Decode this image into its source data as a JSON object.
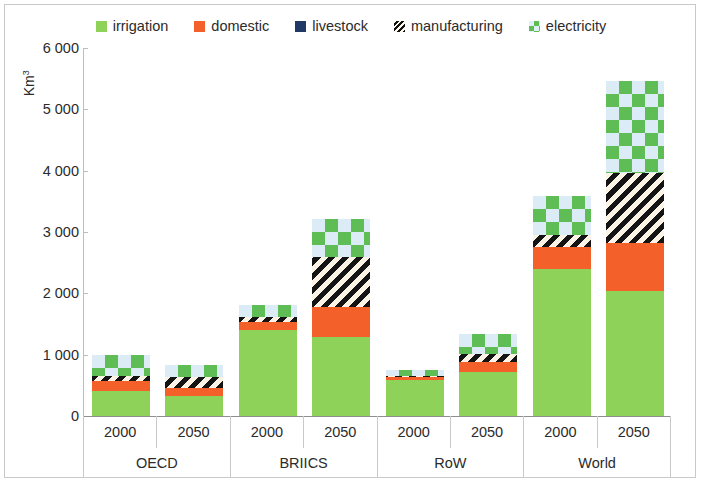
{
  "chart_data": {
    "type": "bar",
    "stacked": true,
    "title": "",
    "xlabel": "",
    "ylabel": "Km3",
    "ylabel_display": "Km",
    "ylabel_superscript": "3",
    "ylim": [
      0,
      6000
    ],
    "y_ticks": [
      "0",
      "1 000",
      "2 000",
      "3 000",
      "4 000",
      "5 000",
      "6 000"
    ],
    "y_tick_values": [
      0,
      1000,
      2000,
      3000,
      4000,
      5000,
      6000
    ],
    "grid": false,
    "legend_position": "top",
    "groups": [
      "OECD",
      "BRIICS",
      "RoW",
      "World"
    ],
    "years": [
      "2000",
      "2050"
    ],
    "categories": [
      "OECD 2000",
      "OECD 2050",
      "BRIICS 2000",
      "BRIICS 2050",
      "RoW 2000",
      "RoW 2050",
      "World 2000",
      "World 2050"
    ],
    "series": [
      {
        "name": "irrigation",
        "color": "#8ed25a",
        "pattern": "solid",
        "values": [
          400,
          330,
          1400,
          1290,
          590,
          720,
          2390,
          2040
        ]
      },
      {
        "name": "domestic",
        "color": "#f4602a",
        "pattern": "solid",
        "values": [
          170,
          120,
          140,
          480,
          40,
          160,
          360,
          780
        ]
      },
      {
        "name": "livestock",
        "color": "#1f3864",
        "pattern": "solid",
        "values": [
          0,
          0,
          0,
          0,
          0,
          0,
          0,
          0
        ]
      },
      {
        "name": "manufacturing",
        "color": "#141414",
        "pattern": "diagonal-hatch",
        "values": [
          90,
          185,
          75,
          830,
          30,
          135,
          200,
          1140
        ]
      },
      {
        "name": "electricity",
        "color": "#5fbd56",
        "pattern": "diamond-check",
        "values": [
          340,
          205,
          200,
          620,
          90,
          330,
          640,
          1510
        ]
      }
    ],
    "totals": [
      1000,
      840,
      1815,
      3220,
      750,
      1345,
      3590,
      5470
    ]
  },
  "legend": {
    "items": [
      {
        "label": "irrigation",
        "icon": "square-swatch-icon",
        "swatch_class": "sw-irrigation"
      },
      {
        "label": "domestic",
        "icon": "square-swatch-icon",
        "swatch_class": "sw-domestic"
      },
      {
        "label": "livestock",
        "icon": "square-swatch-icon",
        "swatch_class": "sw-livestock"
      },
      {
        "label": "manufacturing",
        "icon": "hatched-swatch-icon",
        "swatch_class": "sw-manufacturing"
      },
      {
        "label": "electricity",
        "icon": "checkered-swatch-icon",
        "swatch_class": "sw-electricity"
      }
    ]
  },
  "x_axis": {
    "year_cells": [
      "2000",
      "2050",
      "2000",
      "2050",
      "2000",
      "2050",
      "2000",
      "2050"
    ],
    "group_cells": [
      "OECD",
      "BRIICS",
      "RoW",
      "World"
    ]
  }
}
